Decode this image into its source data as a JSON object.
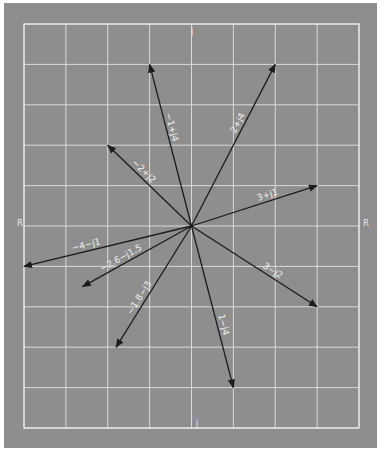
{
  "diagram": {
    "title": "",
    "background_color": "#8e8e8e",
    "grid_color": "#d9d9d9",
    "vector_color": "#1c1c1c",
    "label_color": "#f0f0f0",
    "grid": {
      "x_range": [
        -4,
        4
      ],
      "y_range": [
        -5,
        5
      ]
    },
    "axis_labels": {
      "top": "j",
      "bottom": "j",
      "left": "R",
      "right": "R"
    },
    "vectors": [
      {
        "name": "vector-neg1-plus-j4",
        "label": "−1+j4",
        "re": -1,
        "im": 4
      },
      {
        "name": "vector-2-plus-j4",
        "label": "2+j4",
        "re": 2,
        "im": 4
      },
      {
        "name": "vector-neg2-plus-j2",
        "label": "−2+j2",
        "re": -2,
        "im": 2
      },
      {
        "name": "vector-3-plus-j1",
        "label": "3+j1",
        "re": 3,
        "im": 1
      },
      {
        "name": "vector-neg4-minus-j1",
        "label": "−4−j1",
        "re": -4,
        "im": -1
      },
      {
        "name": "vector-neg2.6-minus-j1.5",
        "label": "−2.6−j1.5",
        "re": -2.6,
        "im": -1.5
      },
      {
        "name": "vector-3-minus-j2",
        "label": "3−j2",
        "re": 3,
        "im": -2
      },
      {
        "name": "vector-neg1.8-minus-j3",
        "label": "−1.8−j3",
        "re": -1.8,
        "im": -3
      },
      {
        "name": "vector-1-minus-j4",
        "label": "1−j4",
        "re": 1,
        "im": -4
      }
    ]
  }
}
